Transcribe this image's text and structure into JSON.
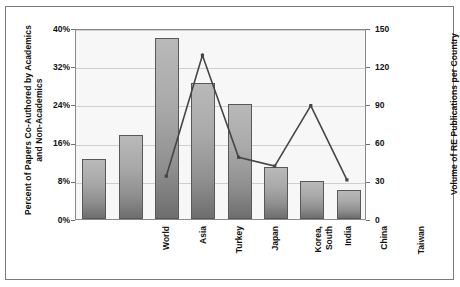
{
  "chart_data": {
    "type": "bar",
    "title": "",
    "categories": [
      "World",
      "Asia",
      "Turkey",
      "Japan",
      "Korea, South",
      "India",
      "China",
      "Taiwan"
    ],
    "category_lines": [
      [
        "World"
      ],
      [
        "Asia"
      ],
      [
        "Turkey"
      ],
      [
        "Japan"
      ],
      [
        "Korea,",
        "South"
      ],
      [
        "India"
      ],
      [
        "China"
      ],
      [
        "Taiwan"
      ]
    ],
    "series": [
      {
        "name": "Percent of Papers Co-Authored by Academics and Non-Academics",
        "type": "bar",
        "axis": "left",
        "values": [
          12.5,
          17.5,
          38,
          28.5,
          24,
          11,
          8,
          6
        ]
      },
      {
        "name": "Volume of RE Publications per Country",
        "type": "line",
        "axis": "right",
        "values": [
          null,
          null,
          34,
          130,
          49,
          42,
          90,
          31
        ]
      }
    ],
    "xlabel": "",
    "ylabel": "Percent of Papers Co-Authored by Academics and Non-Academics",
    "y2label": "Volume of RE Publications per Country",
    "ylim": [
      0,
      40
    ],
    "y2lim": [
      0,
      150
    ],
    "yticks": [
      "0%",
      "8%",
      "16%",
      "24%",
      "32%",
      "40%"
    ],
    "ytick_values": [
      0,
      8,
      16,
      24,
      32,
      40
    ],
    "y2ticks": [
      "0",
      "30",
      "60",
      "90",
      "120",
      "150"
    ],
    "y2tick_values": [
      0,
      30,
      60,
      90,
      120,
      150
    ],
    "grid": true,
    "legend": "none",
    "colors": {
      "bar_top": "#b9b9b9",
      "bar_bottom": "#6e6e6e",
      "bar_border": "#585858",
      "line": "#454545",
      "plot_background": "#f7f7f7",
      "gridline": "#cfcfcf",
      "axis": "#8a8a8a",
      "frame": "#7a7a7a",
      "text": "#111111"
    }
  },
  "axes": {
    "left_title": "Percent of Papers Co-Authored by Academics and Non-Academics",
    "right_title": "Volume of RE Publications per Country"
  }
}
